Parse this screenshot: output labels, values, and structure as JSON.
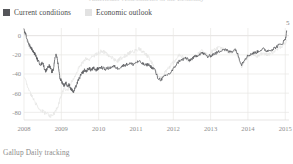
{
  "header": {
    "clipped_title": "Americans' Assessments of the Economy"
  },
  "legend": {
    "position": "top-left",
    "items": [
      {
        "label": "Current conditions",
        "color": "#55565a",
        "key": "current_conditions"
      },
      {
        "label": "Economic outlook",
        "color": "#e2e2e2",
        "key": "economic_outlook"
      }
    ]
  },
  "footer": {
    "source": "Gallup Daily tracking"
  },
  "annotations": [
    {
      "text": "5",
      "series": "current_conditions",
      "position": "end-top-right"
    }
  ],
  "chart_data": {
    "type": "line",
    "title": "",
    "subtitle": "",
    "xlabel": "",
    "ylabel": "",
    "grid": true,
    "legend_position": "top-left",
    "xlim": [
      2008.0,
      2015.1
    ],
    "ylim": [
      -88,
      8
    ],
    "yticks": [
      0,
      -20,
      -40,
      -60,
      -80
    ],
    "ytick_labels": [
      "0",
      "-20",
      "-40",
      "-60",
      "-80"
    ],
    "xticks": [
      2008,
      2009,
      2010,
      2011,
      2012,
      2013,
      2014,
      2015
    ],
    "xtick_labels": [
      "2008",
      "2009",
      "2010",
      "2011",
      "2012",
      "2013",
      "2014",
      "2015"
    ],
    "end_value_label": "5",
    "series": [
      {
        "name": "Current conditions",
        "color": "#5c5d61",
        "x": [
          2008.0,
          2008.04,
          2008.08,
          2008.12,
          2008.17,
          2008.21,
          2008.25,
          2008.29,
          2008.33,
          2008.37,
          2008.42,
          2008.46,
          2008.5,
          2008.54,
          2008.58,
          2008.62,
          2008.67,
          2008.71,
          2008.75,
          2008.79,
          2008.83,
          2008.87,
          2008.92,
          2008.96,
          2009.0,
          2009.04,
          2009.08,
          2009.12,
          2009.17,
          2009.21,
          2009.25,
          2009.29,
          2009.33,
          2009.37,
          2009.42,
          2009.46,
          2009.5,
          2009.54,
          2009.58,
          2009.62,
          2009.67,
          2009.71,
          2009.75,
          2009.79,
          2009.83,
          2009.87,
          2009.92,
          2009.96,
          2010.0,
          2010.08,
          2010.17,
          2010.25,
          2010.33,
          2010.42,
          2010.5,
          2010.58,
          2010.67,
          2010.75,
          2010.83,
          2010.92,
          2011.0,
          2011.08,
          2011.17,
          2011.25,
          2011.33,
          2011.42,
          2011.5,
          2011.58,
          2011.67,
          2011.75,
          2011.83,
          2011.92,
          2012.0,
          2012.08,
          2012.17,
          2012.25,
          2012.33,
          2012.42,
          2012.5,
          2012.58,
          2012.67,
          2012.75,
          2012.83,
          2012.92,
          2013.0,
          2013.08,
          2013.17,
          2013.25,
          2013.33,
          2013.42,
          2013.5,
          2013.58,
          2013.67,
          2013.75,
          2013.83,
          2013.92,
          2014.0,
          2014.08,
          2014.17,
          2014.25,
          2014.33,
          2014.42,
          2014.5,
          2014.58,
          2014.67,
          2014.75,
          2014.83,
          2014.92,
          2015.0,
          2015.04
        ],
        "values": [
          6,
          2,
          -3,
          -8,
          -12,
          -14,
          -17,
          -19,
          -22,
          -26,
          -29,
          -30,
          -28,
          -33,
          -37,
          -34,
          -31,
          -34,
          -38,
          -35,
          -22,
          -20,
          -31,
          -44,
          -47,
          -50,
          -52,
          -49,
          -53,
          -51,
          -55,
          -57,
          -59,
          -55,
          -50,
          -46,
          -43,
          -40,
          -38,
          -36,
          -37,
          -35,
          -34,
          -36,
          -35,
          -34,
          -36,
          -35,
          -34,
          -33,
          -35,
          -34,
          -33,
          -32,
          -34,
          -33,
          -31,
          -30,
          -29,
          -30,
          -28,
          -27,
          -29,
          -31,
          -30,
          -33,
          -35,
          -44,
          -46,
          -43,
          -41,
          -39,
          -35,
          -30,
          -26,
          -25,
          -23,
          -26,
          -24,
          -22,
          -20,
          -18,
          -19,
          -22,
          -21,
          -19,
          -18,
          -16,
          -14,
          -15,
          -17,
          -16,
          -14,
          -22,
          -30,
          -24,
          -21,
          -19,
          -18,
          -17,
          -15,
          -14,
          -16,
          -15,
          -14,
          -12,
          -10,
          -8,
          -4,
          5
        ]
      },
      {
        "name": "Economic outlook",
        "color": "#e6e5e4",
        "x": [
          2008.0,
          2008.08,
          2008.17,
          2008.25,
          2008.33,
          2008.42,
          2008.5,
          2008.58,
          2008.67,
          2008.75,
          2008.83,
          2008.92,
          2009.0,
          2009.08,
          2009.17,
          2009.25,
          2009.33,
          2009.42,
          2009.5,
          2009.58,
          2009.67,
          2009.75,
          2009.83,
          2009.92,
          2010.0,
          2010.08,
          2010.17,
          2010.25,
          2010.33,
          2010.42,
          2010.5,
          2010.58,
          2010.67,
          2010.75,
          2010.83,
          2010.92,
          2011.0,
          2011.08,
          2011.17,
          2011.25,
          2011.33,
          2011.42,
          2011.5,
          2011.58,
          2011.67,
          2011.75,
          2011.83,
          2011.92,
          2012.0,
          2012.08,
          2012.17,
          2012.25,
          2012.33,
          2012.42,
          2012.5,
          2012.58,
          2012.67,
          2012.75,
          2012.83,
          2012.92,
          2013.0,
          2013.08,
          2013.17,
          2013.25,
          2013.33,
          2013.42,
          2013.5,
          2013.58,
          2013.67,
          2013.75,
          2013.83,
          2013.92,
          2014.0,
          2014.08,
          2014.17,
          2014.25,
          2014.33,
          2014.42,
          2014.5,
          2014.58,
          2014.67,
          2014.75,
          2014.83,
          2014.92,
          2015.0,
          2015.04
        ],
        "values": [
          -42,
          -52,
          -60,
          -66,
          -72,
          -76,
          -79,
          -81,
          -83,
          -84,
          -80,
          -72,
          -62,
          -54,
          -58,
          -50,
          -44,
          -38,
          -32,
          -28,
          -24,
          -26,
          -22,
          -20,
          -18,
          -16,
          -18,
          -20,
          -22,
          -25,
          -27,
          -24,
          -22,
          -20,
          -18,
          -17,
          -15,
          -14,
          -16,
          -19,
          -22,
          -28,
          -34,
          -42,
          -44,
          -40,
          -36,
          -32,
          -28,
          -24,
          -20,
          -22,
          -24,
          -27,
          -25,
          -22,
          -19,
          -16,
          -18,
          -21,
          -18,
          -15,
          -13,
          -12,
          -14,
          -16,
          -18,
          -17,
          -15,
          -24,
          -32,
          -26,
          -22,
          -20,
          -19,
          -21,
          -20,
          -18,
          -20,
          -19,
          -17,
          -15,
          -13,
          -11,
          -8,
          -5
        ]
      }
    ]
  }
}
